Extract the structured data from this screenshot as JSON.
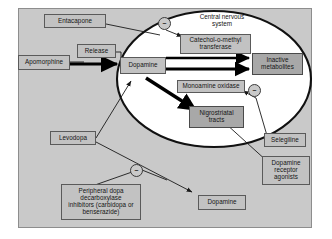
{
  "diagram": {
    "title_label": "Central nervous system",
    "type": "pharmacology-flow-diagram",
    "colors": {
      "canvas": "#c9c9c9",
      "box_fill": "#c2c2c2",
      "box_fill_dark": "#a8a8a8",
      "box_border": "#5a5a5a",
      "ellipse_stroke": "#111111",
      "ellipse_fill": "#ffffff",
      "arrow_thin": "#1a1a1a",
      "arrow_thick": "#000000",
      "text": "#141414"
    },
    "nodes": [
      {
        "id": "entacapone",
        "label": "Entacapone"
      },
      {
        "id": "apomorphine",
        "label": "Apomorphine"
      },
      {
        "id": "release",
        "label": "Release"
      },
      {
        "id": "dopamine_cns",
        "label": "Dopamine"
      },
      {
        "id": "comt",
        "label": "Catechol-o-methyl transferase"
      },
      {
        "id": "inactive",
        "label": "Inactive metabolites"
      },
      {
        "id": "mao",
        "label": "Monoamine oxidase"
      },
      {
        "id": "nigrostriatal",
        "label": "Nigrostriatal tracts"
      },
      {
        "id": "selegiline",
        "label": "Selegiline"
      },
      {
        "id": "dra",
        "label": "Dopamine receptor agonists"
      },
      {
        "id": "levodopa",
        "label": "Levodopa"
      },
      {
        "id": "pdi",
        "label": "Peripheral dopa decarboxylase inhibitors (carbidopa or benserazide)"
      },
      {
        "id": "dopamine_periph",
        "label": "Dopamine"
      }
    ],
    "node_text": {
      "entacapone": "Entacapone",
      "apomorphine": "Apomorphine",
      "release": "Release",
      "dopamine_cns": "Dopamine",
      "comt_line1": "Catechol-o-methyl",
      "comt_line2": "transferase",
      "inactive_line1": "Inactive",
      "inactive_line2": "metabolites",
      "mao": "Monoamine oxidase",
      "nigro_line1": "Nigrostriatal",
      "nigro_line2": "tracts",
      "selegiline": "Selegiline",
      "dra_line1": "Dopamine",
      "dra_line2": "receptor",
      "dra_line3": "agonists",
      "levodopa": "Levodopa",
      "pdi_line1": "Peripheral dopa",
      "pdi_line2": "decarboxylase",
      "pdi_line3": "inhibitors (carbidopa or",
      "pdi_line4": "benserazide)",
      "dopamine_periph": "Dopamine",
      "cns_line1": "Central nervous",
      "cns_line2": "system"
    },
    "inhibition_markers": [
      {
        "id": "minus-comt",
        "symbol": "–",
        "target": "Catechol-o-methyl transferase"
      },
      {
        "id": "minus-mao",
        "symbol": "–",
        "target": "Monoamine oxidase"
      },
      {
        "id": "minus-periph",
        "symbol": "–",
        "target": "Peripheral dopa decarboxylase"
      }
    ],
    "edges": [
      {
        "from": "Entacapone",
        "to": "Catechol-o-methyl transferase",
        "kind": "inhibition"
      },
      {
        "from": "Apomorphine",
        "to": "Release",
        "kind": "stimulate"
      },
      {
        "from": "Release",
        "to": "Dopamine",
        "kind": "stimulate"
      },
      {
        "from": "Dopamine",
        "to": "Inactive metabolites",
        "kind": "metabolism-comt"
      },
      {
        "from": "Dopamine",
        "to": "Inactive metabolites",
        "kind": "metabolism-mao"
      },
      {
        "from": "Dopamine",
        "to": "Nigrostriatal tracts",
        "kind": "action"
      },
      {
        "from": "Selegiline",
        "to": "Monoamine oxidase",
        "kind": "inhibition"
      },
      {
        "from": "Dopamine receptor agonists",
        "to": "Nigrostriatal tracts",
        "kind": "stimulate"
      },
      {
        "from": "Levodopa",
        "to": "Dopamine",
        "kind": "conversion"
      },
      {
        "from": "Levodopa",
        "to": "Dopamine (peripheral)",
        "kind": "conversion"
      },
      {
        "from": "Peripheral dopa decarboxylase inhibitors",
        "to": "Levodopa conversion",
        "kind": "inhibition"
      }
    ]
  }
}
